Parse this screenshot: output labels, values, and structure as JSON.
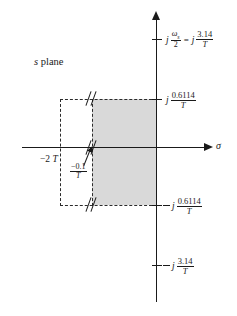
{
  "figure": {
    "plane_label_italic": "s",
    "plane_label_word": " plane",
    "real_axis_label": "σ",
    "background_color": "#ffffff",
    "shade_color": "#d9d9d9",
    "line_color": "#1a1a1a"
  },
  "axes": {
    "real_axis_name": "sigma-axis",
    "imag_axis_name": "jw-axis"
  },
  "labels": {
    "top": {
      "j_symbol": "j",
      "omega_sub": "ω",
      "omega_subscript": "s",
      "omega_denominator": "2",
      "equals": "=",
      "j_symbol2": "j",
      "numerator": "3.14",
      "denominator": "T"
    },
    "upper_boundary": {
      "j_symbol": "j",
      "numerator": "0.6114",
      "denominator": "T"
    },
    "lower_boundary": {
      "minus": "−",
      "j_symbol": "j",
      "numerator": "0.6114",
      "denominator": "T"
    },
    "bottom": {
      "minus": "−",
      "j_symbol": "j",
      "numerator": "3.14",
      "denominator": "T"
    },
    "left_tick": {
      "value": "−2",
      "variable": "T"
    },
    "damping_label": {
      "numerator": "−0.1",
      "denominator": "T"
    }
  },
  "chart_data": {
    "type": "scatter",
    "title": "s plane",
    "xlabel": "σ",
    "ylabel": "jω",
    "grid": false,
    "legend": null,
    "annotations": [
      {
        "name": "omega-s-over-2",
        "text": "j ωs/2 = j 3.14/T",
        "axis": "imaginary",
        "value": 3.14,
        "normalized_by": "T"
      },
      {
        "name": "upper-region-bound",
        "text": "j 0.6114/T",
        "axis": "imaginary",
        "value": 0.6114,
        "normalized_by": "T"
      },
      {
        "name": "lower-region-bound",
        "text": "− j 0.6114/T",
        "axis": "imaginary",
        "value": -0.6114,
        "normalized_by": "T"
      },
      {
        "name": "negative-omega-s-over-2",
        "text": "− j 3.14/T",
        "axis": "imaginary",
        "value": -3.14,
        "normalized_by": "T"
      },
      {
        "name": "left-real-bound",
        "text": "−2 T",
        "axis": "real",
        "value": -2,
        "normalized_by": "T"
      },
      {
        "name": "right-real-bound",
        "text": "−0.1/T",
        "axis": "real",
        "value": -0.1,
        "normalized_by": "T"
      }
    ],
    "shaded_region": {
      "real_range": [
        -0.1,
        0
      ],
      "imag_range": [
        -0.6114,
        0.6114
      ],
      "note": "acceptable region in the s plane, bounded on the left by σ = −0.1/T and above/below by ±j 0.6114/T"
    },
    "dashed_construction_box": {
      "real_range": [
        -2,
        -0.1
      ],
      "imag_range": [
        -0.6114,
        0.6114
      ]
    },
    "axis_breaks": [
      {
        "name": "break-top",
        "location": "upper dashed boundary"
      },
      {
        "name": "break-mid",
        "location": "real axis"
      },
      {
        "name": "break-bottom",
        "location": "lower dashed boundary"
      }
    ]
  }
}
